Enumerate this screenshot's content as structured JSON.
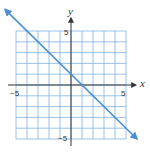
{
  "chart_data": {
    "type": "line",
    "title": "",
    "xlabel": "x",
    "ylabel": "y",
    "xlim": [
      -5,
      5
    ],
    "ylim": [
      -5,
      5
    ],
    "grid": true,
    "grid_step": 1,
    "x_tick_labels": [
      {
        "value": -5,
        "label": "−5"
      },
      {
        "value": 5,
        "label": "5"
      }
    ],
    "y_tick_labels": [
      {
        "value": 5,
        "label": "5"
      },
      {
        "value": -5,
        "label": "−5"
      }
    ],
    "series": [
      {
        "name": "y = -x + 1",
        "slope": -1,
        "intercept": 1,
        "x": [
          -6,
          6
        ],
        "y": [
          7,
          -5
        ],
        "arrows": "both",
        "color": "#4a8fd0"
      }
    ],
    "legend": null
  },
  "colors": {
    "grid": "#7fb3e6",
    "axis": "#333333",
    "line": "#4a8fd0"
  },
  "labels": {
    "x_axis": "x",
    "y_axis": "y",
    "x_min": "−5",
    "x_max": "5",
    "y_max": "5",
    "y_min": "−5"
  }
}
